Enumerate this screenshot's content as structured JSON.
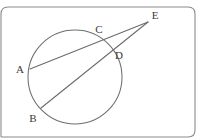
{
  "figure": {
    "background_color": "#ffffff",
    "stroke_color": "#6a6a6a",
    "frame_color": "#8a8a8a",
    "label_color": "#3a3a3a"
  },
  "frame": {
    "name": "page-border",
    "x": 1,
    "y": 7,
    "width": 194,
    "height": 130,
    "corner_radius": 7
  },
  "circle": {
    "name": "main-circle",
    "cx": 75,
    "cy": 77,
    "r": 47
  },
  "points": [
    {
      "id": "A",
      "label": "A",
      "x": 30,
      "y": 69,
      "label_x": 20,
      "label_y": 70,
      "on_circle": true
    },
    {
      "id": "B",
      "label": "B",
      "x": 41,
      "y": 108,
      "label_x": 33,
      "label_y": 119,
      "on_circle": true
    },
    {
      "id": "C",
      "label": "C",
      "x": 100,
      "y": 40,
      "label_x": 99,
      "label_y": 30,
      "on_circle": true
    },
    {
      "id": "D",
      "label": "D",
      "x": 110,
      "y": 51,
      "label_x": 119,
      "label_y": 56,
      "on_circle": true
    },
    {
      "id": "E",
      "label": "E",
      "x": 148,
      "y": 22,
      "label_x": 155,
      "label_y": 16,
      "on_circle": false
    }
  ],
  "segments": [
    {
      "id": "AE",
      "name": "secant-a-c-e",
      "from": "A",
      "to": "E",
      "x1": 30,
      "y1": 69,
      "x2": 148,
      "y2": 22
    },
    {
      "id": "BE",
      "name": "secant-b-d-e",
      "from": "B",
      "to": "E",
      "x1": 41,
      "y1": 108,
      "x2": 148,
      "y2": 22
    }
  ]
}
